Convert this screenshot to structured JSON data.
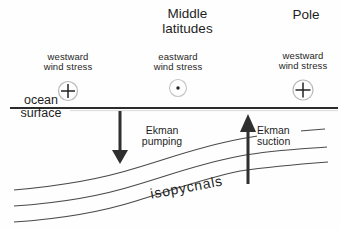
{
  "colors": {
    "background": "#fefefe",
    "ink": "#1e1e1e",
    "curve_line": "#4a4a4a",
    "surface_line": "#2b2b2b",
    "circle_outline": "#b8b8b8",
    "arrow": "#2f2f2f"
  },
  "headers": {
    "middle": "Middle\nlatitudes",
    "pole": "Pole"
  },
  "wind_stress": {
    "left": {
      "label": "westward\nwind stress",
      "symbol": "circle-plus-into-page"
    },
    "middle": {
      "label": "eastward\nwind stress",
      "symbol": "circle-dot-out-of-page"
    },
    "right": {
      "label": "westward\nwind stress",
      "symbol": "circle-plus-into-page"
    }
  },
  "labels": {
    "ocean_surface": "ocean\nsurface",
    "ekman_pumping": "Ekman\npumping",
    "ekman_suction": "Ekman\nsuction",
    "isopycnals": "isopycnals"
  }
}
